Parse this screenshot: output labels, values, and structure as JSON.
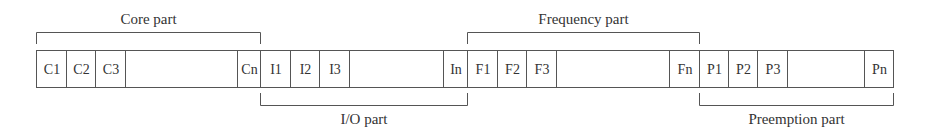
{
  "diagram": {
    "type": "segmented-bit-field",
    "groups": [
      {
        "id": "core",
        "label": "Core part",
        "bracket": "top",
        "cells": [
          "C1",
          "C2",
          "C3",
          "",
          "Cn"
        ]
      },
      {
        "id": "io",
        "label": "I/O part",
        "bracket": "bottom",
        "cells": [
          "I1",
          "I2",
          "I3",
          "",
          "In"
        ]
      },
      {
        "id": "frequency",
        "label": "Frequency part",
        "bracket": "top",
        "cells": [
          "F1",
          "F2",
          "F3",
          "",
          "Fn"
        ]
      },
      {
        "id": "preemption",
        "label": "Preemption part",
        "bracket": "bottom",
        "cells": [
          "P1",
          "P2",
          "P3",
          "",
          "Pn"
        ]
      }
    ]
  }
}
